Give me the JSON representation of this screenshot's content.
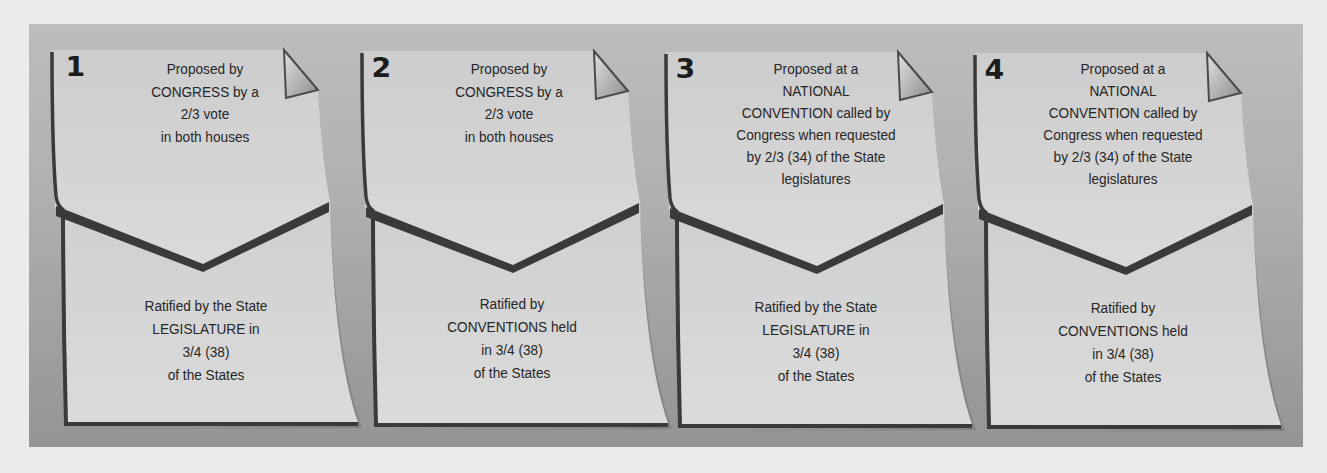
{
  "diagram": {
    "title": "",
    "colors": {
      "page_background": "#ebebeb",
      "panel_top": "#bdbdbd",
      "panel_bottom": "#949494",
      "card_fill": "#d3d3d3",
      "card_fill_lower": "#d7d7d7",
      "outline": "#3a3a3a",
      "text": "#262626"
    },
    "methods": [
      {
        "number": "1",
        "proposal": "Proposed by\nCONGRESS by a\n2/3 vote\nin both houses",
        "ratification": "Ratified by the State\nLEGISLATURE in\n3/4 (38)\nof the States"
      },
      {
        "number": "2",
        "proposal": "Proposed by\nCONGRESS by a\n2/3 vote\nin both houses",
        "ratification": "Ratified by\nCONVENTIONS held\nin 3/4 (38)\nof the States"
      },
      {
        "number": "3",
        "proposal": "Proposed at a\nNATIONAL\nCONVENTION called by\nCongress when requested\nby 2/3 (34) of the State\nlegislatures",
        "ratification": "Ratified by the State\nLEGISLATURE in\n3/4 (38)\nof the States"
      },
      {
        "number": "4",
        "proposal": "Proposed at a\nNATIONAL\nCONVENTION called by\nCongress when requested\nby 2/3 (34) of the State\nlegislatures",
        "ratification": "Ratified by\nCONVENTIONS held\nin 3/4 (38)\nof the States"
      }
    ]
  }
}
